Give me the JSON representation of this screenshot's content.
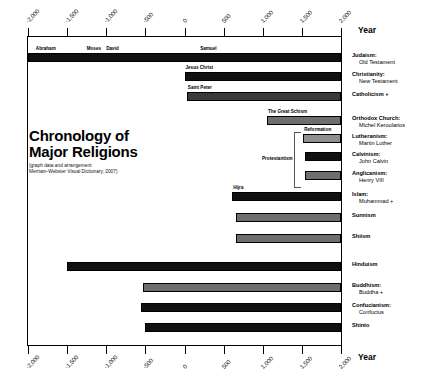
{
  "chart_data": {
    "type": "bar",
    "title_line1": "Chronology of",
    "title_line2": "Major Religions",
    "subtitle_line1": "(graph data and arrangement:",
    "subtitle_line2": "Merriam-Webster Visual Dictionary, 2007)",
    "xlabel": "Year",
    "xlim": [
      -2000,
      2000
    ],
    "orientation": "horizontal",
    "grid": false,
    "legend": "none",
    "axis_top_label": "Year",
    "axis_bottom_label": "Year",
    "ticks": [
      {
        "value": -2000,
        "label": "-2,000"
      },
      {
        "value": -1500,
        "label": "-1,500"
      },
      {
        "value": -1000,
        "label": "-1,000"
      },
      {
        "value": -500,
        "label": "-500"
      },
      {
        "value": 0,
        "label": "0"
      },
      {
        "value": 500,
        "label": "500"
      },
      {
        "value": 1000,
        "label": "1,000"
      },
      {
        "value": 1500,
        "label": "1,500"
      },
      {
        "value": 2000,
        "label": "2,000"
      }
    ],
    "categories": [
      "Judaism",
      "Christianity",
      "Catholicism",
      "Orthodox Church",
      "Lutheranism",
      "Calvinism",
      "Anglicanism",
      "Islam",
      "Sunnism",
      "Shiism",
      "Hinduism",
      "Buddhism",
      "Confucianism",
      "Shinto"
    ],
    "bars": [
      {
        "name": "Judaism",
        "start": -2000,
        "end": 2000,
        "shade": "black"
      },
      {
        "name": "Christianity",
        "start": 0,
        "end": 2000,
        "shade": "black"
      },
      {
        "name": "Catholicism",
        "start": 30,
        "end": 2000,
        "shade": "dark"
      },
      {
        "name": "Orthodox Church",
        "start": 1054,
        "end": 2000,
        "shade": "mid"
      },
      {
        "name": "Lutheranism",
        "start": 1517,
        "end": 2000,
        "shade": "light"
      },
      {
        "name": "Calvinism",
        "start": 1536,
        "end": 2000,
        "shade": "black"
      },
      {
        "name": "Anglicanism",
        "start": 1534,
        "end": 2000,
        "shade": "mid"
      },
      {
        "name": "Islam",
        "start": 610,
        "end": 2000,
        "shade": "black"
      },
      {
        "name": "Sunnism",
        "start": 661,
        "end": 2000,
        "shade": "mid"
      },
      {
        "name": "Shiism",
        "start": 661,
        "end": 2000,
        "shade": "mid"
      },
      {
        "name": "Hinduism",
        "start": -1500,
        "end": 2000,
        "shade": "black"
      },
      {
        "name": "Buddhism",
        "start": -525,
        "end": 2000,
        "shade": "mid"
      },
      {
        "name": "Confucianism",
        "start": -550,
        "end": 2000,
        "shade": "black"
      },
      {
        "name": "Shinto",
        "start": -500,
        "end": 2000,
        "shade": "black"
      }
    ],
    "annotations": [
      {
        "text": "Abraham",
        "year": -1900
      },
      {
        "text": "Moses",
        "year": -1250
      },
      {
        "text": "David",
        "year": -1000
      },
      {
        "text": "Samuel",
        "year": 200
      },
      {
        "text": "Jesus Christ",
        "year": 0
      },
      {
        "text": "Saint Peter",
        "year": 30
      },
      {
        "text": "The Great Schism",
        "year": 1054
      },
      {
        "text": "Reformation",
        "year": 1517
      },
      {
        "text": "Hijra",
        "year": 622
      }
    ],
    "bracket_label": "Protestantism"
  },
  "row_labels": [
    {
      "primary": "Judaism:",
      "secondary": "Old Testament"
    },
    {
      "primary": "Christianity:",
      "secondary": "New Testament"
    },
    {
      "primary": "Catholicism +",
      "secondary": ""
    },
    {
      "primary": "Orthodox Church:",
      "secondary": "Michel Keroularios"
    },
    {
      "primary": "Lutheranism:",
      "secondary": "Martin Luther"
    },
    {
      "primary": "Calvinism:",
      "secondary": "John Calvin"
    },
    {
      "primary": "Anglicanism:",
      "secondary": "Henry VIII"
    },
    {
      "primary": "Islam:",
      "secondary": "Muhammad +"
    },
    {
      "primary": "Sunnism",
      "secondary": ""
    },
    {
      "primary": "Shiism",
      "secondary": ""
    },
    {
      "primary": "Hinduism",
      "secondary": ""
    },
    {
      "primary": "Buddhism:",
      "secondary": "Buddha +"
    },
    {
      "primary": "Confucianism:",
      "secondary": "Confucius"
    },
    {
      "primary": "Shinto",
      "secondary": ""
    }
  ]
}
